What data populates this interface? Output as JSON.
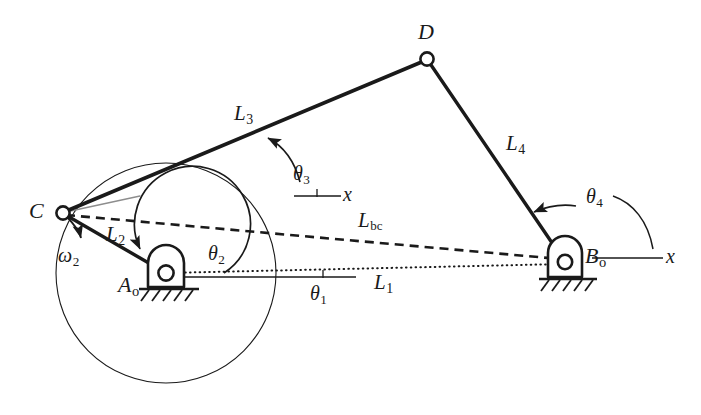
{
  "figure": {
    "type": "four-bar-linkage-kinematic-diagram",
    "background_color": "#ffffff",
    "ink_color": "#1a1a1a"
  },
  "labels": {
    "point_c": "C",
    "point_d": "D",
    "ground_pivot_a": "A",
    "ground_pivot_a_sub": "o",
    "ground_pivot_b": "B",
    "ground_pivot_b_sub": "o",
    "link1": "L",
    "link1_sub": "1",
    "link2": "L",
    "link2_sub": "2",
    "link3": "L",
    "link3_sub": "3",
    "link4": "L",
    "link4_sub": "4",
    "diagonal_bc": "L",
    "diagonal_bc_sub": "bc",
    "theta1": "θ",
    "theta1_sub": "1",
    "theta2": "θ",
    "theta2_sub": "2",
    "theta3": "θ",
    "theta3_sub": "3",
    "theta4": "θ",
    "theta4_sub": "4",
    "omega2": "ω",
    "omega2_sub": "2",
    "x_axis_theta3": "x",
    "x_axis_theta4": "x"
  },
  "geometry": {
    "points": {
      "C": {
        "x": 62,
        "y": 213
      },
      "A0": {
        "x": 166,
        "y": 273
      },
      "D": {
        "x": 427,
        "y": 59
      },
      "B0": {
        "x": 565,
        "y": 262
      }
    },
    "crank_circle": {
      "cx": 166,
      "cy": 273,
      "r": 110
    },
    "links": [
      {
        "name": "L2",
        "from": "A0",
        "to": "C",
        "style": "solid-thick"
      },
      {
        "name": "L3",
        "from": "C",
        "to": "D",
        "style": "solid-thick"
      },
      {
        "name": "L4",
        "from": "D",
        "to": "B0",
        "style": "solid-thick"
      },
      {
        "name": "L1",
        "from": "A0",
        "to": "B0",
        "style": "dotted"
      },
      {
        "name": "Lbc",
        "from": "C",
        "to": "B0",
        "style": "dashed"
      }
    ],
    "reference_axes": [
      {
        "name": "theta1-x-axis",
        "x1": 166,
        "y1": 277,
        "x2": 355,
        "y2": 277
      },
      {
        "name": "theta3-x-axis",
        "x1": 295,
        "y1": 196,
        "x2": 340,
        "y2": 196
      },
      {
        "name": "theta4-x-axis",
        "x1": 592,
        "y1": 258,
        "x2": 662,
        "y2": 258
      }
    ]
  },
  "notes": {
    "joint_markers": "open circles at C, D and both ground pivots",
    "ground_supports": "hatched ground symbols beneath A-o and B-o"
  }
}
